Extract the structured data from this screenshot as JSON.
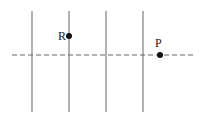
{
  "diagram": {
    "vertical_lines": [
      {
        "x": 32,
        "y1": 11,
        "y2": 112
      },
      {
        "x": 69,
        "y1": 11,
        "y2": 112
      },
      {
        "x": 106,
        "y1": 11,
        "y2": 112
      },
      {
        "x": 143,
        "y1": 11,
        "y2": 112
      }
    ],
    "dashed_line": {
      "x1": 12,
      "x2": 196,
      "y": 55
    },
    "points": [
      {
        "label": "R",
        "x": 69,
        "y": 36,
        "label_x": 58,
        "label_y": 40
      },
      {
        "label": "P",
        "x": 160,
        "y": 55,
        "label_x": 155,
        "label_y": 47
      }
    ],
    "colors": {
      "line": "#888888",
      "dash": "#666666",
      "point": "#111111"
    }
  }
}
